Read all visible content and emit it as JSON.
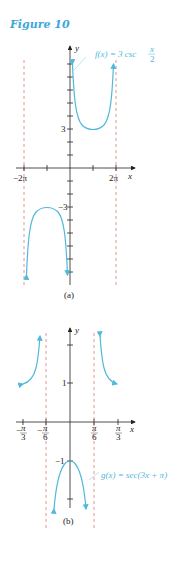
{
  "figure_title": "Figure 10",
  "graph_a": {
    "caption": "(a)",
    "equation": "f(x) = 3 csc x/2",
    "equation_main": "f(x) = 3 csc",
    "equation_num": "x",
    "equation_den": "2",
    "x_axis_label": "x",
    "y_axis_label": "y",
    "x_tick_labels": [
      "−2π",
      "2π"
    ],
    "y_tick_labels": [
      "3",
      "−3"
    ],
    "asymptotes": [
      "x = −2π",
      "x = 0",
      "x = 2π"
    ]
  },
  "graph_b": {
    "caption": "(b)",
    "equation": "g(x) = sec(3x + π)",
    "x_axis_label": "x",
    "y_axis_label": "y",
    "x_tick_labels": [
      "−π/3",
      "−π/6",
      "π/6",
      "π/3"
    ],
    "y_tick_labels": [
      "1",
      "−1"
    ],
    "asymptotes": [
      "x = −π/6",
      "x = π/6"
    ]
  },
  "colors": {
    "curve": "#4fb8dc",
    "asymptote": "#e07a7a",
    "axis": "#222222",
    "title": "#3aa8d8"
  }
}
